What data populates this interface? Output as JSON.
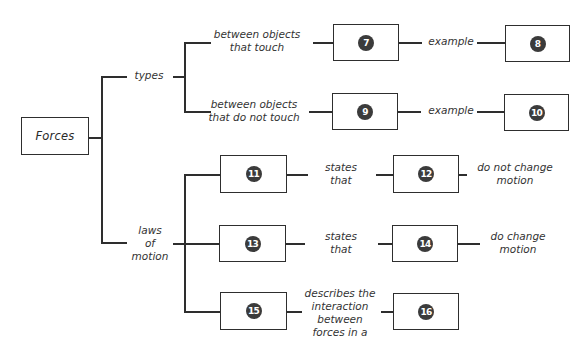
{
  "diagram": {
    "type": "concept-map",
    "root": {
      "label": "Forces"
    },
    "branches": {
      "types": {
        "label": "types",
        "children": [
          {
            "link_label": "between objects\nthat touch",
            "link_lines": [
              "between objects",
              "that touch"
            ],
            "box_number": "7",
            "example_label": "example",
            "example_box_number": "8"
          },
          {
            "link_label": "between objects\nthat do not touch",
            "link_lines": [
              "between objects",
              "that do not touch"
            ],
            "box_number": "9",
            "example_label": "example",
            "example_box_number": "10"
          }
        ]
      },
      "laws": {
        "label_lines": [
          "laws",
          "of",
          "motion"
        ],
        "children": [
          {
            "box_number": "11",
            "link_lines": [
              "states",
              "that"
            ],
            "target_box_number": "12",
            "tail_lines": [
              "do not change",
              "motion"
            ]
          },
          {
            "box_number": "13",
            "link_lines": [
              "states",
              "that"
            ],
            "target_box_number": "14",
            "tail_lines": [
              "do change",
              "motion"
            ]
          },
          {
            "box_number": "15",
            "link_lines": [
              "describes the",
              "interaction",
              "between",
              "forces in a"
            ],
            "target_box_number": "16"
          }
        ]
      }
    },
    "colors": {
      "line": "#2e2e2e",
      "badge": "#3b3b3b",
      "badge_text": "#ffffff",
      "background": "#ffffff"
    }
  }
}
